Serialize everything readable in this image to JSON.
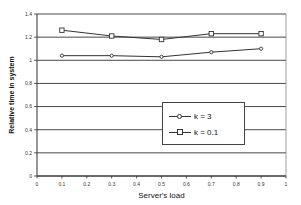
{
  "chart_data": {
    "type": "line",
    "title": "",
    "xlabel": "Server's load",
    "ylabel": "Relative time in system",
    "xlim": [
      0,
      1
    ],
    "ylim": [
      0,
      1.4
    ],
    "xticks": [
      "0",
      "0.1",
      "0.2",
      "0.3",
      "0.4",
      "0.5",
      "0.6",
      "0.7",
      "0.8",
      "0.9",
      "1"
    ],
    "yticks": [
      "0",
      "0.2",
      "0.4",
      "0.6",
      "0.8",
      "1",
      "1.2",
      "1.4"
    ],
    "grid": "horizontal",
    "legend_position": "center-right inside plot",
    "x": [
      0.1,
      0.3,
      0.5,
      0.7,
      0.9
    ],
    "series": [
      {
        "name": "k = 3",
        "marker": "diamond",
        "values": [
          1.04,
          1.04,
          1.03,
          1.07,
          1.1
        ]
      },
      {
        "name": "k = 0.1",
        "marker": "square",
        "values": [
          1.26,
          1.21,
          1.18,
          1.23,
          1.23
        ]
      }
    ]
  },
  "legend": {
    "items": [
      {
        "label": "k = 3"
      },
      {
        "label": "k = 0.1"
      }
    ]
  },
  "axes": {
    "xlabel": "Server's load",
    "ylabel": "Relative time in system"
  }
}
